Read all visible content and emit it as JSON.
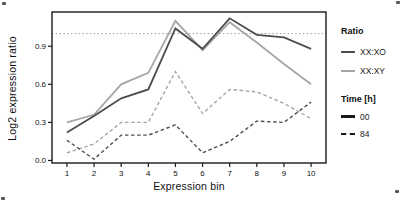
{
  "chart_data": {
    "type": "line",
    "title": "",
    "xlabel": "Expression bin",
    "ylabel": "Log2 expression ratio",
    "x": [
      1,
      2,
      3,
      4,
      5,
      6,
      7,
      8,
      9,
      10
    ],
    "x_ticks": [
      "1",
      "2",
      "3",
      "4",
      "5",
      "6",
      "7",
      "8",
      "9",
      "10"
    ],
    "y_ticks": [
      "0.0",
      "0.3",
      "0.6",
      "0.9"
    ],
    "y_tick_values": [
      0.0,
      0.3,
      0.6,
      0.9
    ],
    "xlim": [
      0.45,
      10.55
    ],
    "ylim": [
      -0.02,
      1.17
    ],
    "grid": false,
    "legend_position": "right",
    "frame_color": "#1a1a1a",
    "reference_line": {
      "y": 1.0,
      "style": "dotted",
      "color": "#999999"
    },
    "series": [
      {
        "name": "XX:XY",
        "time": "00",
        "dash": "solid",
        "color": "#a6a6a6",
        "width": 1.8,
        "values": [
          0.3,
          0.36,
          0.6,
          0.69,
          1.1,
          0.87,
          1.09,
          0.93,
          0.76,
          0.6
        ]
      },
      {
        "name": "XX:XY",
        "time": "84",
        "dash": "dashed",
        "color": "#a6a6a6",
        "width": 1.4,
        "values": [
          0.06,
          0.13,
          0.3,
          0.3,
          0.7,
          0.37,
          0.56,
          0.54,
          0.45,
          0.33
        ]
      },
      {
        "name": "XX:XO",
        "time": "84",
        "dash": "dashed",
        "color": "#4d4d4d",
        "width": 1.4,
        "values": [
          0.16,
          0.01,
          0.2,
          0.2,
          0.28,
          0.06,
          0.15,
          0.31,
          0.3,
          0.46
        ]
      },
      {
        "name": "XX:XO",
        "time": "00",
        "dash": "solid",
        "color": "#4d4d4d",
        "width": 1.8,
        "values": [
          0.22,
          0.35,
          0.49,
          0.56,
          1.04,
          0.88,
          1.12,
          0.99,
          0.97,
          0.88
        ]
      }
    ]
  },
  "legend": {
    "ratio_header": "Ratio",
    "ratio_items": [
      {
        "label": "XX:XO",
        "color": "#4d4d4d",
        "style": "solid",
        "width": 2
      },
      {
        "label": "XX:XY",
        "color": "#a6a6a6",
        "style": "solid",
        "width": 2
      }
    ],
    "time_header": "Time [h]",
    "time_items": [
      {
        "label": "00",
        "color": "#1a1a1a",
        "style": "solid",
        "width": 3
      },
      {
        "label": "84",
        "color": "#1a1a1a",
        "style": "dashed",
        "width": 2
      }
    ]
  }
}
